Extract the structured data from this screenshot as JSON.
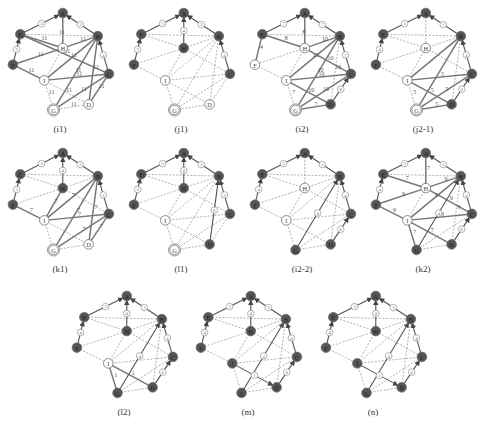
{
  "colors": {
    "dark_node": "#555555",
    "light_node": "#ffffff",
    "node_stroke": "#666666",
    "solid_edge": "#777777",
    "dashed_edge": "#888888",
    "text": "#333333"
  },
  "node_names": [
    "A",
    "B",
    "C",
    "D",
    "G",
    "I",
    "F",
    "E",
    "H"
  ],
  "panels": [
    {
      "id": "i1",
      "caption": "(i1)",
      "dark": [
        "A",
        "B",
        "C",
        "E",
        "F"
      ],
      "double": [
        "G"
      ],
      "tree": [
        [
          "E",
          "A",
          "3"
        ],
        [
          "B",
          "A",
          "3"
        ],
        [
          "F",
          "E",
          "3"
        ],
        [
          "C",
          "B",
          "4"
        ]
      ],
      "solid": [
        [
          "H",
          "A",
          ""
        ],
        [
          "E",
          "H",
          "11"
        ],
        [
          "F",
          "H",
          "11"
        ],
        [
          "F",
          "I",
          "11"
        ],
        [
          "B",
          "H",
          "11"
        ],
        [
          "B",
          "I",
          "11"
        ],
        [
          "B",
          "G",
          "11"
        ],
        [
          "B",
          "D",
          "11"
        ],
        [
          "C",
          "E",
          "11"
        ],
        [
          "C",
          "I",
          "11"
        ],
        [
          "C",
          "G",
          "11"
        ],
        [
          "C",
          "D",
          "11"
        ]
      ],
      "dashed": [
        [
          "E",
          "B",
          "11"
        ],
        [
          "H",
          "I",
          ""
        ],
        [
          "I",
          "G",
          "11"
        ],
        [
          "I",
          "D",
          "11"
        ],
        [
          "G",
          "D",
          "11"
        ]
      ]
    },
    {
      "id": "j1",
      "caption": "(j1)",
      "dark": [
        "A",
        "B",
        "C",
        "E",
        "F",
        "H"
      ],
      "double": [
        "G"
      ],
      "tree": [
        [
          "E",
          "A",
          "3"
        ],
        [
          "B",
          "A",
          "3"
        ],
        [
          "F",
          "E",
          "3"
        ],
        [
          "C",
          "B",
          "4"
        ],
        [
          "H",
          "A",
          "4"
        ]
      ],
      "solid": [],
      "dashed": [
        [
          "E",
          "B",
          ""
        ],
        [
          "E",
          "H",
          ""
        ],
        [
          "F",
          "H",
          ""
        ],
        [
          "F",
          "I",
          ""
        ],
        [
          "B",
          "H",
          ""
        ],
        [
          "B",
          "I",
          ""
        ],
        [
          "B",
          "G",
          ""
        ],
        [
          "B",
          "D",
          ""
        ],
        [
          "H",
          "C",
          ""
        ],
        [
          "H",
          "I",
          ""
        ],
        [
          "I",
          "C",
          ""
        ],
        [
          "I",
          "D",
          ""
        ],
        [
          "I",
          "G",
          ""
        ],
        [
          "G",
          "C",
          ""
        ],
        [
          "G",
          "D",
          ""
        ],
        [
          "D",
          "C",
          ""
        ]
      ]
    },
    {
      "id": "i2",
      "caption": "(i2)",
      "dark": [
        "A",
        "B",
        "C",
        "D",
        "E"
      ],
      "double": [
        "G"
      ],
      "tree": [
        [
          "E",
          "A",
          "7"
        ],
        [
          "B",
          "A",
          "7"
        ],
        [
          "C",
          "B",
          "7"
        ],
        [
          "D",
          "C",
          "8"
        ]
      ],
      "solid": [
        [
          "H",
          "A",
          ""
        ],
        [
          "E",
          "H",
          "8"
        ],
        [
          "F",
          "E",
          "4"
        ],
        [
          "B",
          "H",
          "10"
        ],
        [
          "B",
          "I",
          "10"
        ],
        [
          "B",
          "G",
          "10"
        ],
        [
          "C",
          "H",
          "10"
        ],
        [
          "C",
          "I",
          "10"
        ],
        [
          "C",
          "G",
          "10"
        ],
        [
          "I",
          "D",
          "10"
        ],
        [
          "G",
          "D",
          "7"
        ]
      ],
      "dashed": [
        [
          "E",
          "B",
          "8"
        ],
        [
          "H",
          "F",
          ""
        ],
        [
          "H",
          "I",
          ""
        ],
        [
          "F",
          "I",
          ""
        ],
        [
          "I",
          "G",
          "7"
        ],
        [
          "B",
          "D",
          "10"
        ]
      ]
    },
    {
      "id": "j2-1",
      "caption": "(j2-1)",
      "dark": [
        "A",
        "B",
        "C",
        "D",
        "E",
        "F"
      ],
      "double": [
        "G"
      ],
      "tree": [
        [
          "E",
          "A",
          "3"
        ],
        [
          "B",
          "A",
          "3"
        ],
        [
          "F",
          "E",
          "4"
        ],
        [
          "C",
          "B",
          "4"
        ],
        [
          "D",
          "C",
          "6"
        ]
      ],
      "solid": [
        [
          "B",
          "I",
          ""
        ],
        [
          "B",
          "G",
          ""
        ],
        [
          "I",
          "C",
          "5"
        ],
        [
          "I",
          "D",
          "5"
        ],
        [
          "G",
          "C",
          "5"
        ],
        [
          "G",
          "D",
          "5"
        ]
      ],
      "dashed": [
        [
          "E",
          "B",
          ""
        ],
        [
          "E",
          "H",
          ""
        ],
        [
          "A",
          "H",
          ""
        ],
        [
          "B",
          "H",
          ""
        ],
        [
          "F",
          "H",
          ""
        ],
        [
          "F",
          "I",
          ""
        ],
        [
          "H",
          "I",
          ""
        ],
        [
          "H",
          "C",
          ""
        ],
        [
          "I",
          "G",
          "5"
        ],
        [
          "B",
          "D",
          ""
        ]
      ]
    },
    {
      "id": "k1",
      "caption": "(k1)",
      "dark": [
        "A",
        "B",
        "C",
        "E",
        "F",
        "H"
      ],
      "double": [
        "G"
      ],
      "tree": [
        [
          "E",
          "A",
          "3"
        ],
        [
          "B",
          "A",
          "3"
        ],
        [
          "F",
          "E",
          "3"
        ],
        [
          "C",
          "B",
          "3"
        ],
        [
          "H",
          "A",
          "4"
        ]
      ],
      "solid": [
        [
          "F",
          "I",
          "7"
        ],
        [
          "B",
          "I",
          "7"
        ],
        [
          "B",
          "G",
          "7"
        ],
        [
          "B",
          "D",
          "7"
        ],
        [
          "C",
          "I",
          "7"
        ],
        [
          "C",
          "G",
          "7"
        ],
        [
          "C",
          "D",
          "7"
        ],
        [
          "H",
          "I",
          "7"
        ]
      ],
      "dashed": [
        [
          "E",
          "B",
          ""
        ],
        [
          "E",
          "H",
          ""
        ],
        [
          "F",
          "H",
          ""
        ],
        [
          "B",
          "H",
          ""
        ],
        [
          "H",
          "C",
          ""
        ],
        [
          "I",
          "G",
          ""
        ],
        [
          "I",
          "D",
          ""
        ],
        [
          "G",
          "D",
          ""
        ]
      ]
    },
    {
      "id": "l1",
      "caption": "(l1)",
      "dark": [
        "A",
        "B",
        "C",
        "D",
        "E",
        "F",
        "H"
      ],
      "double": [
        "G"
      ],
      "tree": [
        [
          "E",
          "A",
          "3"
        ],
        [
          "B",
          "A",
          "3"
        ],
        [
          "F",
          "E",
          "3"
        ],
        [
          "C",
          "B",
          "3"
        ],
        [
          "H",
          "A",
          "4"
        ],
        [
          "D",
          "B",
          "6"
        ]
      ],
      "solid": [],
      "dashed": [
        [
          "E",
          "B",
          ""
        ],
        [
          "E",
          "H",
          ""
        ],
        [
          "F",
          "H",
          ""
        ],
        [
          "F",
          "I",
          ""
        ],
        [
          "B",
          "H",
          ""
        ],
        [
          "B",
          "I",
          ""
        ],
        [
          "B",
          "G",
          ""
        ],
        [
          "H",
          "C",
          ""
        ],
        [
          "H",
          "I",
          ""
        ],
        [
          "I",
          "C",
          ""
        ],
        [
          "I",
          "D",
          ""
        ],
        [
          "I",
          "G",
          ""
        ],
        [
          "G",
          "C",
          ""
        ],
        [
          "G",
          "D",
          ""
        ],
        [
          "D",
          "C",
          ""
        ]
      ]
    },
    {
      "id": "i2-2",
      "caption": "(i2-2)",
      "dark": [
        "A",
        "B",
        "C",
        "D",
        "E",
        "F",
        "G"
      ],
      "double": [],
      "tree": [
        [
          "E",
          "A",
          "3"
        ],
        [
          "B",
          "A",
          "3"
        ],
        [
          "F",
          "E",
          "4"
        ],
        [
          "C",
          "B",
          "4"
        ],
        [
          "D",
          "C",
          "6"
        ],
        [
          "G",
          "B",
          "4"
        ]
      ],
      "solid": [],
      "dashed": [
        [
          "E",
          "B",
          ""
        ],
        [
          "E",
          "H",
          ""
        ],
        [
          "A",
          "H",
          ""
        ],
        [
          "B",
          "H",
          ""
        ],
        [
          "F",
          "H",
          ""
        ],
        [
          "F",
          "I",
          ""
        ],
        [
          "B",
          "I",
          ""
        ],
        [
          "H",
          "I",
          ""
        ],
        [
          "H",
          "C",
          ""
        ],
        [
          "I",
          "C",
          ""
        ],
        [
          "I",
          "D",
          ""
        ],
        [
          "I",
          "G",
          ""
        ],
        [
          "G",
          "C",
          ""
        ],
        [
          "G",
          "D",
          ""
        ],
        [
          "B",
          "D",
          ""
        ]
      ]
    },
    {
      "id": "k2",
      "caption": "(k2)",
      "dark": [
        "A",
        "B",
        "C",
        "D",
        "E",
        "F",
        "G"
      ],
      "double": [],
      "tree": [
        [
          "E",
          "A",
          "3"
        ],
        [
          "B",
          "A",
          "3"
        ],
        [
          "F",
          "E",
          "4"
        ],
        [
          "C",
          "B",
          "4"
        ],
        [
          "D",
          "C",
          "6"
        ],
        [
          "G",
          "B",
          "4"
        ]
      ],
      "solid": [
        [
          "H",
          "A",
          "7"
        ],
        [
          "E",
          "H",
          "7"
        ],
        [
          "F",
          "H",
          "9"
        ],
        [
          "F",
          "I",
          "9"
        ],
        [
          "B",
          "H",
          "9"
        ],
        [
          "B",
          "I",
          "9"
        ],
        [
          "H",
          "C",
          "9"
        ],
        [
          "I",
          "C",
          "9"
        ],
        [
          "I",
          "D",
          "7"
        ],
        [
          "I",
          "G",
          "7"
        ]
      ],
      "dashed": [
        [
          "E",
          "B",
          ""
        ],
        [
          "H",
          "I",
          ""
        ],
        [
          "G",
          "C",
          ""
        ],
        [
          "G",
          "D",
          ""
        ],
        [
          "B",
          "D",
          "9"
        ]
      ]
    },
    {
      "id": "l2",
      "caption": "(l2)",
      "dark": [
        "A",
        "B",
        "C",
        "D",
        "E",
        "F",
        "G",
        "H"
      ],
      "double": [],
      "tree": [
        [
          "E",
          "A",
          "3"
        ],
        [
          "B",
          "A",
          "3"
        ],
        [
          "F",
          "E",
          "4"
        ],
        [
          "C",
          "B",
          "4"
        ],
        [
          "D",
          "C",
          "6"
        ],
        [
          "G",
          "B",
          "4"
        ],
        [
          "H",
          "A",
          "4"
        ]
      ],
      "solid": [
        [
          "I",
          "D",
          "1"
        ],
        [
          "I",
          "G",
          "1"
        ]
      ],
      "dashed": [
        [
          "E",
          "B",
          ""
        ],
        [
          "E",
          "H",
          ""
        ],
        [
          "F",
          "H",
          ""
        ],
        [
          "F",
          "I",
          ""
        ],
        [
          "B",
          "H",
          ""
        ],
        [
          "B",
          "I",
          ""
        ],
        [
          "H",
          "I",
          ""
        ],
        [
          "H",
          "C",
          ""
        ],
        [
          "I",
          "C",
          ""
        ],
        [
          "G",
          "C",
          ""
        ],
        [
          "G",
          "D",
          ""
        ],
        [
          "B",
          "D",
          ""
        ]
      ]
    },
    {
      "id": "m",
      "caption": "(m)",
      "dark": [
        "A",
        "B",
        "C",
        "D",
        "E",
        "F",
        "G",
        "H",
        "I"
      ],
      "double": [],
      "tree": [
        [
          "E",
          "A",
          "3"
        ],
        [
          "B",
          "A",
          "3"
        ],
        [
          "F",
          "E",
          "4"
        ],
        [
          "C",
          "B",
          "4"
        ],
        [
          "D",
          "C",
          "6"
        ],
        [
          "G",
          "B",
          "4"
        ],
        [
          "H",
          "A",
          "4"
        ],
        [
          "I",
          "D",
          "1"
        ]
      ],
      "solid": [],
      "dashed": [
        [
          "E",
          "B",
          ""
        ],
        [
          "E",
          "H",
          ""
        ],
        [
          "F",
          "H",
          ""
        ],
        [
          "F",
          "I",
          ""
        ],
        [
          "B",
          "H",
          ""
        ],
        [
          "B",
          "I",
          ""
        ],
        [
          "H",
          "I",
          ""
        ],
        [
          "H",
          "C",
          ""
        ],
        [
          "I",
          "C",
          ""
        ],
        [
          "I",
          "G",
          ""
        ],
        [
          "G",
          "C",
          ""
        ],
        [
          "G",
          "D",
          ""
        ],
        [
          "B",
          "D",
          ""
        ]
      ]
    },
    {
      "id": "n",
      "caption": "(n)",
      "dark": [
        "A",
        "B",
        "C",
        "D",
        "E",
        "F",
        "G",
        "H",
        "I"
      ],
      "double": [],
      "tree": [
        [
          "E",
          "A",
          "3"
        ],
        [
          "B",
          "A",
          "3"
        ],
        [
          "F",
          "E",
          "4"
        ],
        [
          "C",
          "B",
          "4"
        ],
        [
          "D",
          "C",
          "6"
        ],
        [
          "G",
          "B",
          "4"
        ],
        [
          "H",
          "A",
          "4"
        ],
        [
          "I",
          "D",
          "1"
        ]
      ],
      "solid": [],
      "dashed": [
        [
          "E",
          "B",
          ""
        ],
        [
          "E",
          "H",
          ""
        ],
        [
          "F",
          "H",
          ""
        ],
        [
          "F",
          "I",
          ""
        ],
        [
          "B",
          "H",
          ""
        ],
        [
          "B",
          "I",
          ""
        ],
        [
          "H",
          "I",
          ""
        ],
        [
          "H",
          "C",
          ""
        ],
        [
          "I",
          "C",
          ""
        ],
        [
          "I",
          "G",
          ""
        ],
        [
          "G",
          "C",
          ""
        ],
        [
          "G",
          "D",
          ""
        ],
        [
          "B",
          "D",
          ""
        ]
      ]
    }
  ]
}
